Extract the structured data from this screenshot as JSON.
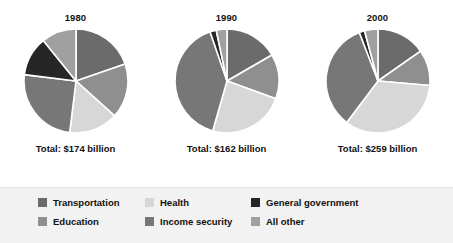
{
  "chart_data": {
    "type": "pie",
    "title": "",
    "legend_position": "bottom",
    "categories": [
      "Transportation",
      "Education",
      "Health",
      "Income security",
      "General government",
      "All other"
    ],
    "colors": {
      "Transportation": "#6b6b6b",
      "Education": "#8f8f8f",
      "Health": "#d7d7d7",
      "Income security": "#777777",
      "General government": "#262626",
      "All other": "#a0a0a0"
    },
    "charts": [
      {
        "year": "1980",
        "total_label": "Total: $174 billion",
        "total_value": 174,
        "units": "billion dollars",
        "slices": [
          {
            "label": "Transportation",
            "degrees": 71,
            "percent": 19.7
          },
          {
            "label": "Education",
            "degrees": 61,
            "percent": 16.9
          },
          {
            "label": "Health",
            "degrees": 55,
            "percent": 15.3
          },
          {
            "label": "Income security",
            "degrees": 90,
            "percent": 25.0
          },
          {
            "label": "General government",
            "degrees": 44,
            "percent": 12.2
          },
          {
            "label": "All other",
            "degrees": 39,
            "percent": 10.9
          }
        ]
      },
      {
        "year": "1990",
        "total_label": "Total: $162 billion",
        "total_value": 162,
        "units": "billion dollars",
        "slices": [
          {
            "label": "Transportation",
            "degrees": 60,
            "percent": 16.7
          },
          {
            "label": "Education",
            "degrees": 50,
            "percent": 13.9
          },
          {
            "label": "Health",
            "degrees": 86,
            "percent": 23.9
          },
          {
            "label": "Income security",
            "degrees": 145,
            "percent": 40.3
          },
          {
            "label": "General government",
            "degrees": 7,
            "percent": 1.9
          },
          {
            "label": "All other",
            "degrees": 12,
            "percent": 3.3
          }
        ]
      },
      {
        "year": "2000",
        "total_label": "Total: $259 billion",
        "total_value": 259,
        "units": "billion dollars",
        "slices": [
          {
            "label": "Transportation",
            "degrees": 55,
            "percent": 15.3
          },
          {
            "label": "Education",
            "degrees": 40,
            "percent": 11.1
          },
          {
            "label": "Health",
            "degrees": 122,
            "percent": 33.9
          },
          {
            "label": "Income security",
            "degrees": 122,
            "percent": 33.9
          },
          {
            "label": "General government",
            "degrees": 6,
            "percent": 1.7
          },
          {
            "label": "All other",
            "degrees": 15,
            "percent": 4.1
          }
        ]
      }
    ]
  },
  "legend": {
    "columns": [
      [
        {
          "label": "Transportation",
          "color": "#6b6b6b"
        },
        {
          "label": "Education",
          "color": "#8f8f8f"
        }
      ],
      [
        {
          "label": "Health",
          "color": "#d7d7d7"
        },
        {
          "label": "Income security",
          "color": "#777777"
        }
      ],
      [
        {
          "label": "General government",
          "color": "#262626"
        },
        {
          "label": "All other",
          "color": "#a0a0a0"
        }
      ]
    ]
  }
}
